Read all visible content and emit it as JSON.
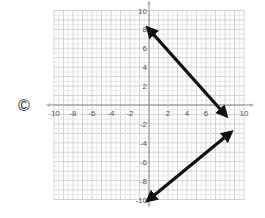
{
  "choice_label": "©",
  "chart_data": {
    "type": "line",
    "title": "",
    "xlabel": "",
    "ylabel": "",
    "xlim": [
      -10,
      10
    ],
    "ylim": [
      -10,
      10
    ],
    "grid": true,
    "x_ticks": [
      -10,
      -8,
      -6,
      -4,
      -2,
      2,
      4,
      6,
      8,
      10
    ],
    "y_ticks": [
      10,
      8,
      6,
      4,
      2,
      -2,
      -4,
      -6,
      -8,
      -10
    ],
    "series": [
      {
        "name": "line1",
        "x": [
          0,
          8
        ],
        "y": [
          8,
          -1
        ],
        "arrows": "both"
      },
      {
        "name": "line2",
        "x": [
          0,
          8.5
        ],
        "y": [
          -10,
          -3
        ],
        "arrows": "both"
      }
    ]
  }
}
